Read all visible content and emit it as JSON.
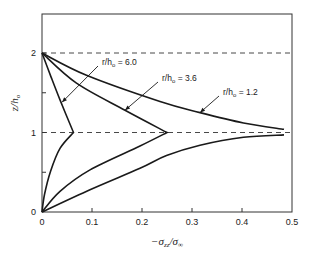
{
  "chart_data": {
    "type": "line",
    "title": "",
    "xlabel": "-σ_zz/σ_∞",
    "xlabel_parts": {
      "prefix": "−σ",
      "sub": "zz",
      "mid": "/σ",
      "sub2": "∞"
    },
    "ylabel": "z/h₀",
    "ylabel_parts": {
      "main": "z/h",
      "sub": "o"
    },
    "xlim": [
      0,
      0.5
    ],
    "ylim": [
      0,
      2.3
    ],
    "x_ticks": [
      0,
      0.1,
      0.2,
      0.3,
      0.4,
      0.5
    ],
    "x_tick_labels": [
      "0",
      "0.1",
      "0.2",
      "0.3",
      "0.4",
      "0.5"
    ],
    "y_ticks": [
      0,
      0.5,
      1,
      1.5,
      2
    ],
    "y_tick_labels": [
      "0",
      "",
      "1",
      "",
      "2"
    ],
    "reference_lines": [
      {
        "axis": "y",
        "value": 1,
        "style": "dashed"
      },
      {
        "axis": "y",
        "value": 2,
        "style": "dashed"
      }
    ],
    "grid": false,
    "series": [
      {
        "name": "r/h₀ = 6.0",
        "label_main": "r/h",
        "label_sub": "o",
        "label_value": "= 6.0",
        "points": [
          [
            0,
            0
          ],
          [
            0.005,
            0.22
          ],
          [
            0.017,
            0.51
          ],
          [
            0.036,
            0.8
          ],
          [
            0.063,
            1.0
          ],
          [
            0.036,
            1.41
          ],
          [
            0.018,
            1.7
          ],
          [
            0,
            2.0
          ]
        ],
        "annotation_target": [
          0.04,
          1.38
        ]
      },
      {
        "name": "r/h₀ = 3.6",
        "label_main": "r/h",
        "label_sub": "o",
        "label_value": "= 3.6",
        "points": [
          [
            0,
            0
          ],
          [
            0.036,
            0.26
          ],
          [
            0.096,
            0.53
          ],
          [
            0.196,
            0.83
          ],
          [
            0.25,
            1.0
          ],
          [
            0.166,
            1.28
          ],
          [
            0.069,
            1.62
          ],
          [
            0,
            2.0
          ]
        ],
        "annotation_target": [
          0.166,
          1.28
        ]
      },
      {
        "name": "r/h₀ = 1.2",
        "label_main": "r/h",
        "label_sub": "o",
        "label_value": "= 1.2",
        "segments": [
          [
            [
              0,
              0
            ],
            [
              0.096,
              0.28
            ],
            [
              0.196,
              0.55
            ],
            [
              0.249,
              0.71
            ],
            [
              0.316,
              0.84
            ],
            [
              0.403,
              0.94
            ],
            [
              0.484,
              0.97
            ]
          ],
          [
            [
              0,
              2.0
            ],
            [
              0.089,
              1.72
            ],
            [
              0.236,
              1.39
            ],
            [
              0.316,
              1.25
            ],
            [
              0.403,
              1.12
            ],
            [
              0.484,
              1.04
            ]
          ]
        ],
        "annotation_target": [
          0.316,
          1.25
        ]
      }
    ]
  }
}
